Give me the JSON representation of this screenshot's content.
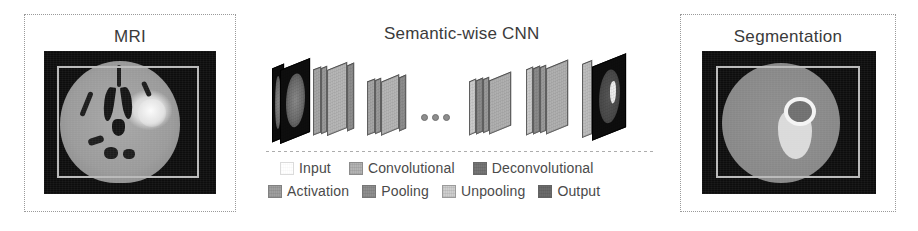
{
  "figure": {
    "panels": {
      "mri": {
        "title": "MRI",
        "image_name": "axial-brain-mri-flair-with-hyperintense-lesion"
      },
      "segmentation": {
        "title": "Segmentation",
        "image_name": "axial-brain-segmentation-mask-with-lesion-overlay"
      }
    },
    "cnn": {
      "title": "Semantic-wise CNN",
      "ellipsis": "• • •",
      "stages": [
        {
          "name": "input",
          "label": "Input",
          "color": "#0e0e0e"
        },
        {
          "name": "convolutional",
          "label": "Convolutional",
          "color": "#b4b4b4"
        },
        {
          "name": "activation",
          "label": "Activation",
          "color": "#a0a0a0"
        },
        {
          "name": "pooling",
          "label": "Pooling",
          "color": "#8f8f8f"
        },
        {
          "name": "unpooling",
          "label": "Unpooling",
          "color": "#cfcfcf"
        },
        {
          "name": "deconvolutional",
          "label": "Deconvolutional",
          "color": "#767676"
        },
        {
          "name": "output",
          "label": "Output",
          "color": "#6b6b6b"
        }
      ],
      "legend": {
        "row1": [
          {
            "name": "input",
            "label": "Input",
            "color": "#ffffff",
            "blank": true
          },
          {
            "name": "convolutional",
            "label": "Convolutional",
            "color": "#b4b4b4",
            "blank": false
          },
          {
            "name": "deconvolutional",
            "label": "Deconvolutional",
            "color": "#767676",
            "blank": false
          }
        ],
        "row2": [
          {
            "name": "activation",
            "label": "Activation",
            "color": "#a0a0a0",
            "blank": false
          },
          {
            "name": "pooling",
            "label": "Pooling",
            "color": "#8f8f8f",
            "blank": false
          },
          {
            "name": "unpooling",
            "label": "Unpooling",
            "color": "#cfcfcf",
            "blank": false
          },
          {
            "name": "output",
            "label": "Output",
            "color": "#6b6b6b",
            "blank": false
          }
        ]
      }
    },
    "colors": {
      "background": "#ffffff",
      "panel_border": "#9a9a9a",
      "text": "#3a3a3a",
      "scan_background": "#0d0d0d",
      "scan_inner_border": "#b9b9b9"
    }
  }
}
